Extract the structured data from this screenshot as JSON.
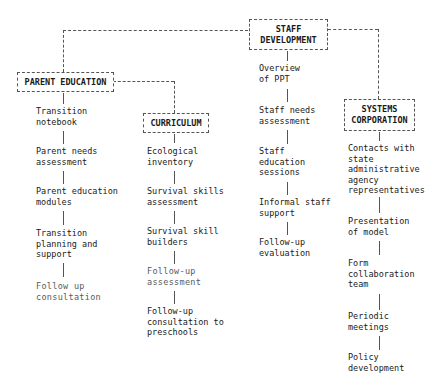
{
  "diagram": {
    "root": {
      "label": "STAFF\nDEVELOPMENT"
    },
    "branches": [
      {
        "label": "PARENT EDUCATION",
        "items": [
          "Transition\nnotebook",
          "Parent needs\nassessment",
          "Parent education\nmodules",
          "Transition\nplanning and\nsupport",
          "Follow up\nconsultation"
        ]
      },
      {
        "label": "CURRICULUM",
        "items": [
          "Ecological\ninventory",
          "Survival skills\nassessment",
          "Survival skill\nbuilders",
          "Follow-up\nassessment",
          "Follow-up\nconsultation to\npreschools"
        ]
      },
      {
        "label": "STAFF DEVELOPMENT",
        "items": [
          "Overview\nof PPT",
          "Staff needs\nassessment",
          "Staff\neducation\nsessions",
          "Informal staff\nsupport",
          "Follow-up\nevaluation"
        ]
      },
      {
        "label": "SYSTEMS\nCORPORATION",
        "items": [
          "Contacts with\nstate\nadministrative\nagency\nrepresentatives",
          "Presentation\nof model",
          "Form\ncollaboration\nteam",
          "Periodic\nmeetings",
          "Policy\ndevelopment"
        ]
      }
    ]
  }
}
